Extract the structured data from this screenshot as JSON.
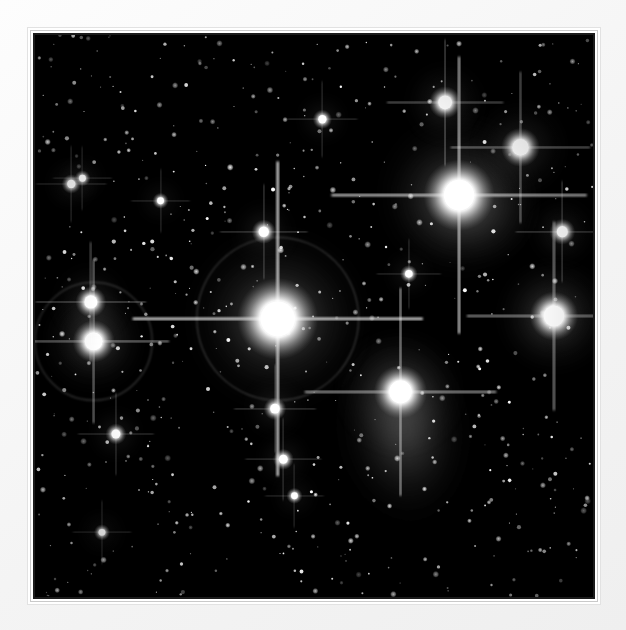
{
  "image": {
    "kind": "astrophotograph",
    "subject": "open star cluster with reflection nebulosity",
    "rendering": "black-and-white photographic plate",
    "presentation": "white matted frame with thin dark inner border",
    "background_color": "#000000",
    "mat_color": "#f5f5f5",
    "frame_line_color": "#1b1b1b",
    "star_color": "#ffffff",
    "nebula_color": "#b9b9b9"
  },
  "frame": {
    "mat_left": 28,
    "mat_top": 28,
    "mat_width": 572,
    "mat_height": 576,
    "plate_inset": 8
  },
  "chart_data": {
    "type": "scatter",
    "title": "",
    "xlabel": "",
    "ylabel": "",
    "xlim": [
      0,
      100
    ],
    "ylim": [
      0,
      100
    ],
    "grid": false,
    "legend": "none",
    "note": "Positions are percentages of the photographic plate area; size is the visual radius of the stellar disc in plate-percent; brightness 0-1.",
    "bright_stars": [
      {
        "name": "central-brightest-star",
        "x": 43.5,
        "y": 50.5,
        "size": 5.0,
        "brightness": 1.0,
        "spikes": 26,
        "halo_ring": true,
        "halo_ring_radius": 14.5
      },
      {
        "name": "upper-right-nebulous-star",
        "x": 76.0,
        "y": 28.5,
        "size": 4.4,
        "brightness": 0.98,
        "spikes": 22,
        "halo_ring": false,
        "halo_ring_radius": 0
      },
      {
        "name": "lower-right-nebula-star",
        "x": 65.5,
        "y": 63.5,
        "size": 3.3,
        "brightness": 0.95,
        "spikes": 19,
        "halo_ring": false,
        "halo_ring_radius": 0
      },
      {
        "name": "right-edge-star",
        "x": 93.0,
        "y": 50.0,
        "size": 3.0,
        "brightness": 0.94,
        "spikes": 18,
        "halo_ring": false,
        "halo_ring_radius": 0
      },
      {
        "name": "left-edge-star",
        "x": 10.5,
        "y": 54.5,
        "size": 2.6,
        "brightness": 0.92,
        "spikes": 17,
        "halo_ring": true,
        "halo_ring_radius": 10.5
      },
      {
        "name": "top-right-star",
        "x": 87.0,
        "y": 20.0,
        "size": 2.4,
        "brightness": 0.9,
        "spikes": 15,
        "halo_ring": false,
        "halo_ring_radius": 0
      },
      {
        "name": "top-centre-right-star",
        "x": 73.5,
        "y": 12.0,
        "size": 2.0,
        "brightness": 0.86,
        "spikes": 13,
        "halo_ring": false,
        "halo_ring_radius": 0
      },
      {
        "name": "left-upper-companion-star",
        "x": 10.0,
        "y": 47.5,
        "size": 1.9,
        "brightness": 0.84,
        "spikes": 12,
        "halo_ring": false,
        "halo_ring_radius": 0
      },
      {
        "name": "right-upper-small-star",
        "x": 94.5,
        "y": 35.0,
        "size": 1.6,
        "brightness": 0.8,
        "spikes": 11,
        "halo_ring": false,
        "halo_ring_radius": 0
      },
      {
        "name": "centre-upper-star",
        "x": 41.0,
        "y": 35.0,
        "size": 1.5,
        "brightness": 0.78,
        "spikes": 10,
        "halo_ring": false,
        "halo_ring_radius": 0
      },
      {
        "name": "centre-lower-star",
        "x": 43.0,
        "y": 66.5,
        "size": 1.4,
        "brightness": 0.76,
        "spikes": 10,
        "halo_ring": false,
        "halo_ring_radius": 0
      },
      {
        "name": "lower-centre-star",
        "x": 44.5,
        "y": 75.5,
        "size": 1.3,
        "brightness": 0.74,
        "spikes": 9,
        "halo_ring": false,
        "halo_ring_radius": 0
      },
      {
        "name": "left-lower-star",
        "x": 14.5,
        "y": 71.0,
        "size": 1.3,
        "brightness": 0.74,
        "spikes": 9,
        "halo_ring": false,
        "halo_ring_radius": 0
      },
      {
        "name": "upper-left-pair-a",
        "x": 6.5,
        "y": 26.5,
        "size": 1.2,
        "brightness": 0.72,
        "spikes": 8,
        "halo_ring": false,
        "halo_ring_radius": 0
      },
      {
        "name": "upper-left-pair-b",
        "x": 8.5,
        "y": 25.5,
        "size": 1.0,
        "brightness": 0.68,
        "spikes": 7,
        "halo_ring": false,
        "halo_ring_radius": 0
      },
      {
        "name": "upper-centre-star",
        "x": 51.5,
        "y": 15.0,
        "size": 1.2,
        "brightness": 0.72,
        "spikes": 8,
        "halo_ring": false,
        "halo_ring_radius": 0
      },
      {
        "name": "mid-right-small-star",
        "x": 67.0,
        "y": 42.5,
        "size": 1.1,
        "brightness": 0.7,
        "spikes": 8,
        "halo_ring": false,
        "halo_ring_radius": 0
      },
      {
        "name": "centre-left-star",
        "x": 22.5,
        "y": 29.5,
        "size": 1.0,
        "brightness": 0.68,
        "spikes": 7,
        "halo_ring": false,
        "halo_ring_radius": 0
      },
      {
        "name": "lower-left-star",
        "x": 12.0,
        "y": 88.5,
        "size": 1.0,
        "brightness": 0.66,
        "spikes": 7,
        "halo_ring": false,
        "halo_ring_radius": 0
      },
      {
        "name": "bottom-centre-star",
        "x": 46.5,
        "y": 82.0,
        "size": 1.0,
        "brightness": 0.66,
        "spikes": 7,
        "halo_ring": false,
        "halo_ring_radius": 0
      }
    ],
    "nebulae": [
      {
        "name": "merope-style-nebula",
        "x": 66.0,
        "y": 70.0,
        "rx": 11.0,
        "ry": 17.0,
        "intensity": 0.3,
        "rotation": -8
      },
      {
        "name": "upper-right-reflection-nebula",
        "x": 77.0,
        "y": 30.0,
        "rx": 13.0,
        "ry": 11.0,
        "intensity": 0.26,
        "rotation": 12
      },
      {
        "name": "central-star-glow",
        "x": 43.5,
        "y": 50.5,
        "rx": 12.0,
        "ry": 11.0,
        "intensity": 0.22,
        "rotation": 0
      },
      {
        "name": "right-edge-glow",
        "x": 93.0,
        "y": 50.0,
        "rx": 8.0,
        "ry": 8.0,
        "intensity": 0.16,
        "rotation": 0
      },
      {
        "name": "left-edge-glow",
        "x": 10.5,
        "y": 54.0,
        "rx": 7.0,
        "ry": 7.0,
        "intensity": 0.14,
        "rotation": 0
      }
    ],
    "field_star_count": 620,
    "field_star_seed": 20240517
  }
}
